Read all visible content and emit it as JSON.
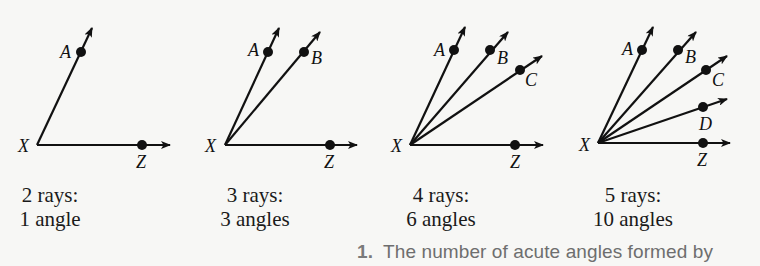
{
  "figures": [
    {
      "id": "fig1",
      "vertex": {
        "label": "X",
        "x": 37,
        "y": 145,
        "lx": 18,
        "ly": 152
      },
      "rays": [
        {
          "label": "A",
          "dot": [
            81,
            52
          ],
          "end": [
            92,
            28
          ],
          "lx": 60,
          "ly": 58
        },
        {
          "label": "Z",
          "dot": [
            142,
            145
          ],
          "end": [
            170,
            145
          ],
          "lx": 136,
          "ly": 168
        }
      ],
      "caption": {
        "line1": "2 rays:",
        "line2": "1 angle",
        "x": 0,
        "w": 90
      }
    },
    {
      "id": "fig2",
      "vertex": {
        "label": "X",
        "x": 225,
        "y": 145,
        "lx": 205,
        "ly": 152
      },
      "rays": [
        {
          "label": "A",
          "dot": [
            268,
            52
          ],
          "end": [
            279,
            28
          ],
          "lx": 248,
          "ly": 56
        },
        {
          "label": "B",
          "dot": [
            304,
            52
          ],
          "end": [
            320,
            32
          ],
          "lx": 311,
          "ly": 64
        },
        {
          "label": "Z",
          "dot": [
            330,
            145
          ],
          "end": [
            357,
            145
          ],
          "lx": 324,
          "ly": 168
        }
      ],
      "caption": {
        "line1": "3 rays:",
        "line2": "3 angles",
        "x": 205,
        "w": 100
      }
    },
    {
      "id": "fig3",
      "vertex": {
        "label": "X",
        "x": 410,
        "y": 145,
        "lx": 391,
        "ly": 152
      },
      "rays": [
        {
          "label": "A",
          "dot": [
            454,
            50
          ],
          "end": [
            465,
            27
          ],
          "lx": 434,
          "ly": 56
        },
        {
          "label": "B",
          "dot": [
            490,
            50
          ],
          "end": [
            508,
            32
          ],
          "lx": 497,
          "ly": 64
        },
        {
          "label": "C",
          "dot": [
            520,
            70
          ],
          "end": [
            542,
            56
          ],
          "lx": 525,
          "ly": 86
        },
        {
          "label": "Z",
          "dot": [
            515,
            145
          ],
          "end": [
            543,
            145
          ],
          "lx": 510,
          "ly": 168
        }
      ],
      "caption": {
        "line1": "4 rays:",
        "line2": "6 angles",
        "x": 393,
        "w": 100
      }
    },
    {
      "id": "fig4",
      "vertex": {
        "label": "X",
        "x": 598,
        "y": 143,
        "lx": 579,
        "ly": 151
      },
      "rays": [
        {
          "label": "A",
          "dot": [
            642,
            50
          ],
          "end": [
            653,
            27
          ],
          "lx": 622,
          "ly": 55
        },
        {
          "label": "B",
          "dot": [
            678,
            50
          ],
          "end": [
            696,
            32
          ],
          "lx": 685,
          "ly": 63
        },
        {
          "label": "C",
          "dot": [
            706,
            70
          ],
          "end": [
            727,
            56
          ],
          "lx": 712,
          "ly": 86
        },
        {
          "label": "D",
          "dot": [
            703,
            107
          ],
          "end": [
            727,
            99
          ],
          "lx": 699,
          "ly": 130
        },
        {
          "label": "Z",
          "dot": [
            703,
            143
          ],
          "end": [
            730,
            143
          ],
          "lx": 697,
          "ly": 166
        }
      ],
      "caption": {
        "line1": "5 rays:",
        "line2": "10 angles",
        "x": 580,
        "w": 110
      }
    }
  ],
  "exercise": {
    "number": "1.",
    "text": "The number of acute angles formed by"
  },
  "colors": {
    "ink": "#111111",
    "background": "#f7f7f5",
    "exercise_text": "#6e6e6e"
  }
}
